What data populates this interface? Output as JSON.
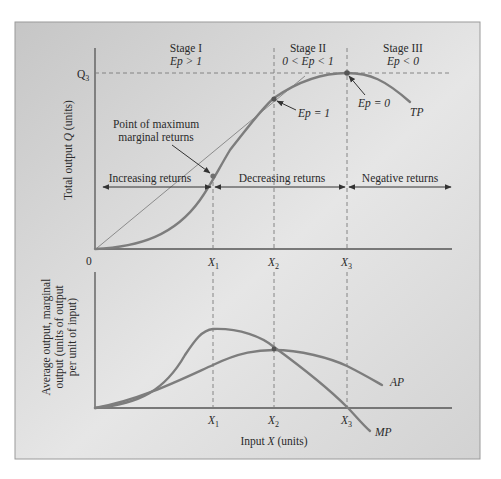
{
  "figure": {
    "colors": {
      "frame_bg_top": "#c9c9c9",
      "frame_bg_bottom": "#f4f4f4",
      "frame_border": "#9a9a9a",
      "curve": "#7d7d7d",
      "axis": "#555555",
      "text": "#2a2a2a"
    }
  },
  "top_panel": {
    "y_axis_label_pre": "Total output ",
    "y_axis_label_var": "Q",
    "y_axis_label_post": " (units)",
    "origin_label": "0",
    "q3_label": "Q",
    "q3_sub": "3",
    "stages": [
      {
        "title": "Stage I",
        "cond": "Ep > 1"
      },
      {
        "title": "Stage II",
        "cond": "0 < Ep < 1"
      },
      {
        "title": "Stage III",
        "cond": "Ep < 0"
      }
    ],
    "x_ticks": [
      {
        "label": "X",
        "sub": "1"
      },
      {
        "label": "X",
        "sub": "2"
      },
      {
        "label": "X",
        "sub": "3"
      }
    ],
    "annotations": {
      "max_marginal_line1": "Point of maximum",
      "max_marginal_line2": "marginal returns",
      "ep1": "Ep = 1",
      "ep0": "Ep = 0",
      "tp": "TP"
    },
    "returns": {
      "increasing": "Increasing returns",
      "decreasing": "Decreasing returns",
      "negative": "Negative returns"
    }
  },
  "bottom_panel": {
    "y_axis_line1": "Average output, marginal",
    "y_axis_line2": "output (units of output",
    "y_axis_line3": "per unit of input)",
    "x_axis_label_pre": "Input ",
    "x_axis_label_var": "X",
    "x_axis_label_post": " (units)",
    "x_ticks": [
      {
        "label": "X",
        "sub": "1"
      },
      {
        "label": "X",
        "sub": "2"
      },
      {
        "label": "X",
        "sub": "3"
      }
    ],
    "curves": {
      "ap": "AP",
      "mp": "MP"
    }
  }
}
